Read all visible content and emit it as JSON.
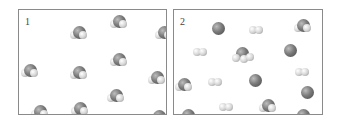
{
  "panels": [
    {
      "label": "1",
      "description": "Box of identical triatomic molecules (water-like, one large central atom with two small atoms)",
      "molecules": [
        {
          "type": "triatomic",
          "x": 52,
          "y": 16
        },
        {
          "type": "triatomic",
          "x": 92,
          "y": 5
        },
        {
          "type": "triatomic",
          "x": 137,
          "y": 16
        },
        {
          "type": "triatomic",
          "x": 3,
          "y": 54
        },
        {
          "type": "triatomic",
          "x": 52,
          "y": 56
        },
        {
          "type": "triatomic",
          "x": 92,
          "y": 43
        },
        {
          "type": "triatomic",
          "x": 130,
          "y": 61
        },
        {
          "type": "triatomic",
          "x": 89,
          "y": 79
        },
        {
          "type": "triatomic",
          "x": 13,
          "y": 95
        },
        {
          "type": "triatomic",
          "x": 53,
          "y": 92
        },
        {
          "type": "triatomic",
          "x": 132,
          "y": 100
        }
      ]
    },
    {
      "label": "2",
      "description": "Box of decomposed mixture: single large atoms, small diatomic molecules, and a few remaining triatomic molecules",
      "molecules": [
        {
          "type": "single",
          "x": 38,
          "y": 12
        },
        {
          "type": "diatomic",
          "x": 75,
          "y": 14
        },
        {
          "type": "triatomic",
          "x": 121,
          "y": 9
        },
        {
          "type": "diatomic",
          "x": 19,
          "y": 36
        },
        {
          "type": "trigonal",
          "x": 60,
          "y": 37
        },
        {
          "type": "single",
          "x": 110,
          "y": 34
        },
        {
          "type": "diatomic",
          "x": 121,
          "y": 56
        },
        {
          "type": "triatomic",
          "x": 2,
          "y": 68
        },
        {
          "type": "diatomic",
          "x": 34,
          "y": 66
        },
        {
          "type": "single",
          "x": 75,
          "y": 64
        },
        {
          "type": "single",
          "x": 127,
          "y": 76
        },
        {
          "type": "diatomic",
          "x": 45,
          "y": 91
        },
        {
          "type": "triatomic",
          "x": 86,
          "y": 89
        },
        {
          "type": "single",
          "x": 8,
          "y": 99
        },
        {
          "type": "triatomic",
          "x": 121,
          "y": 99
        }
      ]
    }
  ],
  "colors": {
    "border": "#8a8a8a",
    "large_atom": "#6a6a6a",
    "small_atom": "#e0e0e0"
  }
}
